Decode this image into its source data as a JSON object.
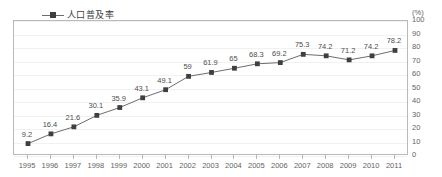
{
  "chart_data": {
    "type": "line",
    "title": "",
    "xlabel": "",
    "ylabel": "",
    "unit_label": "(%)",
    "ylim": [
      0,
      100
    ],
    "ytick_step": 10,
    "yticks": [
      "100",
      "90",
      "80",
      "70",
      "60",
      "50",
      "40",
      "30",
      "20",
      "10",
      "0"
    ],
    "grid": true,
    "legend_position": "top-left",
    "categories": [
      "1995",
      "1996",
      "1997",
      "1998",
      "1999",
      "2000",
      "2001",
      "2002",
      "2003",
      "2004",
      "2005",
      "2006",
      "2007",
      "2008",
      "2009",
      "2010",
      "2011"
    ],
    "series": [
      {
        "name": "人口普及率",
        "values": [
          9.2,
          16.4,
          21.6,
          30.1,
          35.9,
          43.1,
          49.1,
          59,
          61.9,
          65,
          68.3,
          69.2,
          75.3,
          74.2,
          71.2,
          74.2,
          78.2
        ],
        "labels": [
          "9.2",
          "16.4",
          "21.6",
          "30.1",
          "35.9",
          "43.1",
          "49.1",
          "59",
          "61.9",
          "65",
          "68.3",
          "69.2",
          "75.3",
          "74.2",
          "71.2",
          "74.2",
          "78.2"
        ],
        "line_color": "#6d6d6d",
        "marker_color": "#3f3f3f",
        "marker_shape": "square"
      }
    ]
  },
  "legend": {
    "entries": [
      {
        "label": "人口普及率"
      }
    ]
  },
  "colors": {
    "frame": "#b9b9b9",
    "gridline": "#f1f1f1",
    "text": "#636363",
    "series": "#6d6d6d",
    "marker": "#3f3f3f"
  }
}
